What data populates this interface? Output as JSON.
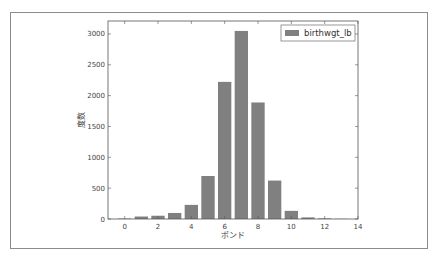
{
  "chart_data": {
    "type": "bar",
    "title": "",
    "xlabel": "ポンド",
    "ylabel": "度数",
    "categories": [
      0,
      1,
      2,
      3,
      4,
      5,
      6,
      7,
      8,
      9,
      10,
      11,
      12,
      13
    ],
    "series": [
      {
        "name": "birthwgt_lb",
        "color": "#808080",
        "values": [
          8,
          40,
          53,
          98,
          229,
          697,
          2223,
          3049,
          1889,
          623,
          132,
          26,
          10,
          3
        ]
      }
    ],
    "xlim": [
      -1,
      14
    ],
    "ylim": [
      0,
      3210
    ],
    "xticks": [
      0,
      2,
      4,
      6,
      8,
      10,
      12,
      14
    ],
    "yticks": [
      0,
      500,
      1000,
      1500,
      2000,
      2500,
      3000
    ],
    "legend_position": "upper right",
    "grid": false
  }
}
